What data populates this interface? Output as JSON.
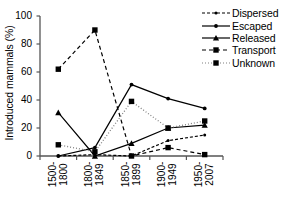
{
  "chart_data": {
    "type": "line",
    "title": "",
    "xlabel": "",
    "ylabel": "Introduced mammals (%)",
    "categories": [
      "1500-1800",
      "1800-1849",
      "1850-1899",
      "1900-1949",
      "1950-2007"
    ],
    "category_lines": [
      [
        "1500-",
        "1800"
      ],
      [
        "1800-",
        "1849"
      ],
      [
        "1850-",
        "1899"
      ],
      [
        "1900-",
        "1949"
      ],
      [
        "1950-",
        "2007"
      ]
    ],
    "ylim": [
      0,
      100
    ],
    "yticks": [
      0,
      20,
      40,
      60,
      80,
      100
    ],
    "ytick_labels": [
      "0",
      "20",
      "40",
      "60",
      "80",
      "100"
    ],
    "grid": false,
    "legend_position": "top-right",
    "series": [
      {
        "name": "Dispersed",
        "values": [
          0,
          1,
          0,
          11,
          15
        ],
        "color": "#000000",
        "dash": "3,2",
        "marker": "dot-small"
      },
      {
        "name": "Escaped",
        "values": [
          0,
          6,
          51,
          41,
          34
        ],
        "color": "#000000",
        "dash": "none",
        "marker": "dot"
      },
      {
        "name": "Released",
        "values": [
          31,
          0,
          9,
          20,
          22
        ],
        "color": "#000000",
        "dash": "none",
        "marker": "triangle"
      },
      {
        "name": "Transport",
        "values": [
          62,
          90,
          0,
          6,
          1
        ],
        "color": "#000000",
        "dash": "4,3",
        "marker": "square"
      },
      {
        "name": "Unknown",
        "values": [
          8,
          3,
          39,
          20,
          25
        ],
        "color": "#808080",
        "dash": "1,2",
        "marker": "square"
      }
    ]
  }
}
